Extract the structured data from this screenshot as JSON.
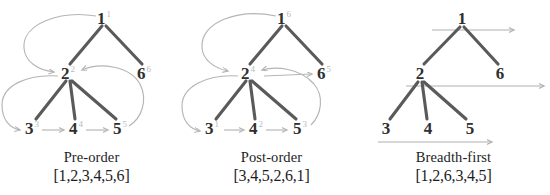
{
  "figure": {
    "background_color": "#ffffff",
    "edge_color": "#5a5a5a",
    "arrow_color": "#b5b5b5",
    "label_color": "#2f2f2f",
    "superscript_color": "#b9b9b9"
  },
  "panels": [
    {
      "id": "pre-order",
      "caption": "Pre-order",
      "sequence": "[1,2,3,4,5,6]",
      "nodes": [
        {
          "label": "1",
          "order": "1",
          "x": 104,
          "y": 18
        },
        {
          "label": "2",
          "order": "2",
          "x": 68,
          "y": 73
        },
        {
          "label": "6",
          "order": "6",
          "x": 144,
          "y": 73
        },
        {
          "label": "3",
          "order": "3",
          "x": 32,
          "y": 128
        },
        {
          "label": "4",
          "order": "4",
          "x": 76,
          "y": 128
        },
        {
          "label": "5",
          "order": "5",
          "x": 120,
          "y": 128
        }
      ],
      "edges": [
        {
          "from": "1",
          "to": "2"
        },
        {
          "from": "1",
          "to": "6"
        },
        {
          "from": "2",
          "to": "3"
        },
        {
          "from": "2",
          "to": "4"
        },
        {
          "from": "2",
          "to": "5"
        }
      ],
      "traversal_arrows": [
        {
          "from": "1",
          "to": "2"
        },
        {
          "from": "2",
          "to": "3"
        },
        {
          "from": "3",
          "to": "4"
        },
        {
          "from": "4",
          "to": "5"
        },
        {
          "from": "5",
          "to": "6"
        }
      ]
    },
    {
      "id": "post-order",
      "caption": "Post-order",
      "sequence": "[3,4,5,2,6,1]",
      "nodes": [
        {
          "label": "1",
          "order": "6",
          "x": 104,
          "y": 18
        },
        {
          "label": "2",
          "order": "4",
          "x": 68,
          "y": 73
        },
        {
          "label": "6",
          "order": "5",
          "x": 144,
          "y": 73
        },
        {
          "label": "3",
          "order": "1",
          "x": 32,
          "y": 128
        },
        {
          "label": "4",
          "order": "2",
          "x": 76,
          "y": 128
        },
        {
          "label": "5",
          "order": "3",
          "x": 120,
          "y": 128
        }
      ],
      "edges": [
        {
          "from": "1",
          "to": "2"
        },
        {
          "from": "1",
          "to": "6"
        },
        {
          "from": "2",
          "to": "3"
        },
        {
          "from": "2",
          "to": "4"
        },
        {
          "from": "2",
          "to": "5"
        }
      ],
      "traversal_arrows": [
        {
          "from": "1",
          "to": "3"
        },
        {
          "from": "3",
          "to": "4"
        },
        {
          "from": "4",
          "to": "5"
        },
        {
          "from": "5",
          "to": "2"
        },
        {
          "from": "2",
          "to": "6"
        }
      ]
    },
    {
      "id": "breadth-first",
      "caption": "Breadth-first",
      "sequence": "[1,2,6,3,4,5]",
      "nodes": [
        {
          "label": "1",
          "order": "",
          "x": 100,
          "y": 18
        },
        {
          "label": "2",
          "order": "",
          "x": 58,
          "y": 73
        },
        {
          "label": "6",
          "order": "",
          "x": 138,
          "y": 73
        },
        {
          "label": "3",
          "order": "",
          "x": 24,
          "y": 128
        },
        {
          "label": "4",
          "order": "",
          "x": 66,
          "y": 128
        },
        {
          "label": "5",
          "order": "",
          "x": 108,
          "y": 128
        }
      ],
      "edges": [
        {
          "from": "1",
          "to": "2"
        },
        {
          "from": "1",
          "to": "6"
        },
        {
          "from": "2",
          "to": "3"
        },
        {
          "from": "2",
          "to": "4"
        },
        {
          "from": "2",
          "to": "5"
        }
      ],
      "level_sweeps": [
        {
          "level": "1",
          "y": 30
        },
        {
          "level": "2",
          "y": 86
        },
        {
          "level": "3",
          "y": 142
        }
      ]
    }
  ]
}
